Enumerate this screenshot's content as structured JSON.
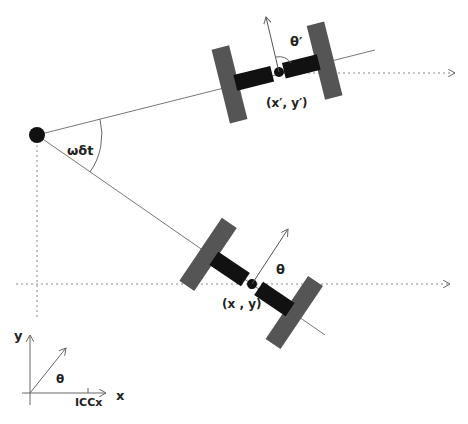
{
  "diagram": {
    "icc": {
      "label": "",
      "x": 37,
      "y": 135
    },
    "angle_label": "ωδt",
    "robot_before": {
      "position_label": "(x , y)",
      "heading_label": "θ"
    },
    "robot_after": {
      "position_label": "(x′, y′)",
      "heading_label": "θ′"
    },
    "axes": {
      "x_label": "x",
      "y_label": "y",
      "theta_label": "θ",
      "icc_label": "ICCx"
    },
    "colors": {
      "wheel": "#555555",
      "axle": "#111111",
      "line": "#777777"
    }
  }
}
